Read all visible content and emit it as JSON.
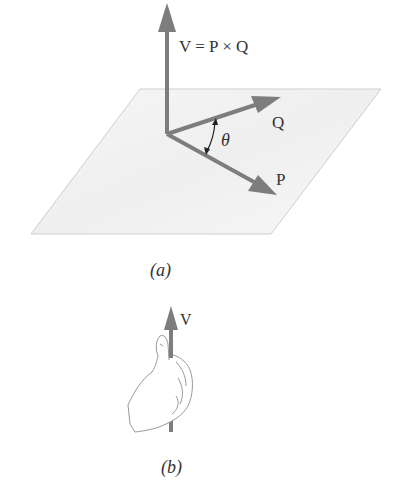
{
  "figure": {
    "part_a": {
      "caption": "(a)",
      "vector_v_label": "V = P × Q",
      "vector_q_label": "Q",
      "vector_p_label": "P",
      "angle_label": "θ"
    },
    "part_b": {
      "caption": "(b)",
      "vector_v_label": "V"
    },
    "colors": {
      "arrow": "#7d7d7d",
      "plane_fill": "#f4f4f4",
      "plane_edge": "#c8c8c8",
      "text": "#333333"
    }
  }
}
